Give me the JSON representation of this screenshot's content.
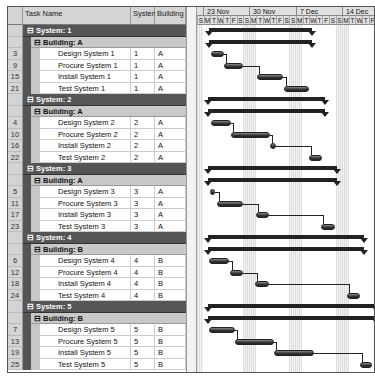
{
  "columns": {
    "task_name": "Task Name",
    "system": "System",
    "building": "Building"
  },
  "timescale": {
    "weeks": [
      {
        "label": "23 Nov",
        "x": 6
      },
      {
        "label": "30 Nov",
        "x": 52
      },
      {
        "label": "7 Dec",
        "x": 99
      },
      {
        "label": "14 Dec",
        "x": 145
      }
    ],
    "days": [
      "S",
      "M",
      "T",
      "W",
      "T",
      "F",
      "S",
      "S",
      "M",
      "T",
      "W",
      "T",
      "F",
      "S",
      "S",
      "M",
      "T",
      "W",
      "T",
      "F",
      "S",
      "S",
      "M",
      "T",
      "W",
      "T",
      "F"
    ],
    "weekend_bands_x": [
      0,
      46,
      92,
      139
    ]
  },
  "rows": [
    {
      "type": "system",
      "label": "System: 1",
      "sum": [
        12,
        115
      ]
    },
    {
      "type": "building",
      "label": "Building: A",
      "sum": [
        12,
        115
      ]
    },
    {
      "type": "task",
      "id": "3",
      "name": "Design System 1",
      "system": "1",
      "building": "A",
      "bar": [
        14,
        27
      ]
    },
    {
      "type": "task",
      "id": "9",
      "name": "Procure System 1",
      "system": "1",
      "building": "A",
      "bar": [
        27,
        46
      ]
    },
    {
      "type": "task",
      "id": "15",
      "name": "Install System 1",
      "system": "1",
      "building": "A",
      "bar": [
        60,
        86
      ]
    },
    {
      "type": "task",
      "id": "21",
      "name": "Test System 1",
      "system": "1",
      "building": "A",
      "bar": [
        87,
        112
      ]
    },
    {
      "type": "system",
      "label": "System: 2",
      "sum": [
        11,
        128
      ]
    },
    {
      "type": "building",
      "label": "Building: A",
      "sum": [
        11,
        128
      ]
    },
    {
      "type": "task",
      "id": "4",
      "name": "Design System 2",
      "system": "2",
      "building": "A",
      "bar": [
        14,
        34
      ]
    },
    {
      "type": "task",
      "id": "10",
      "name": "Procure System 2",
      "system": "2",
      "building": "A",
      "bar": [
        34,
        73
      ]
    },
    {
      "type": "task",
      "id": "16",
      "name": "Install System 2",
      "system": "2",
      "building": "A",
      "bar": [
        73,
        79
      ]
    },
    {
      "type": "task",
      "id": "22",
      "name": "Test System 2",
      "system": "2",
      "building": "A",
      "bar": [
        112,
        125
      ]
    },
    {
      "type": "system",
      "label": "System: 3",
      "sum": [
        11,
        140
      ]
    },
    {
      "type": "building",
      "label": "Building: A",
      "sum": [
        11,
        140
      ]
    },
    {
      "type": "task",
      "id": "5",
      "name": "Design System 3",
      "system": "3",
      "building": "A",
      "bar": [
        13,
        18
      ]
    },
    {
      "type": "task",
      "id": "11",
      "name": "Procure System 3",
      "system": "3",
      "building": "A",
      "bar": [
        20,
        46
      ]
    },
    {
      "type": "task",
      "id": "17",
      "name": "Install System 3",
      "system": "3",
      "building": "A",
      "bar": [
        59,
        72
      ]
    },
    {
      "type": "task",
      "id": "23",
      "name": "Test System 3",
      "system": "3",
      "building": "A",
      "bar": [
        124,
        138
      ]
    },
    {
      "type": "system",
      "label": "System: 4",
      "sum": [
        11,
        167
      ]
    },
    {
      "type": "building",
      "label": "Building: B",
      "sum": [
        11,
        167
      ]
    },
    {
      "type": "task",
      "id": "6",
      "name": "Design System 4",
      "system": "4",
      "building": "B",
      "bar": [
        12,
        32
      ]
    },
    {
      "type": "task",
      "id": "12",
      "name": "Procure System 4",
      "system": "4",
      "building": "B",
      "bar": [
        33,
        46
      ]
    },
    {
      "type": "task",
      "id": "18",
      "name": "Install System 4",
      "system": "4",
      "building": "B",
      "bar": [
        58,
        72
      ]
    },
    {
      "type": "task",
      "id": "24",
      "name": "Test System 4",
      "system": "4",
      "building": "B",
      "bar": [
        150,
        163
      ]
    },
    {
      "type": "system",
      "label": "System: 5",
      "sum": [
        11,
        179
      ]
    },
    {
      "type": "building",
      "label": "Building: B",
      "sum": [
        11,
        179
      ]
    },
    {
      "type": "task",
      "id": "7",
      "name": "Design System 5",
      "system": "5",
      "building": "B",
      "bar": [
        12,
        38
      ]
    },
    {
      "type": "task",
      "id": "13",
      "name": "Procure System 5",
      "system": "5",
      "building": "B",
      "bar": [
        38,
        77
      ]
    },
    {
      "type": "task",
      "id": "19",
      "name": "Install System 5",
      "system": "5",
      "building": "B",
      "bar": [
        77,
        117
      ]
    },
    {
      "type": "task",
      "id": "25",
      "name": "Test System 5",
      "system": "5",
      "building": "B",
      "bar": [
        163,
        175
      ]
    }
  ],
  "icons": {
    "collapse": "⊟"
  },
  "colors": {
    "system_row": "#555555",
    "building_row": "#c8c8c8",
    "bar": "#333333",
    "weekend": "#e4e4e4"
  }
}
